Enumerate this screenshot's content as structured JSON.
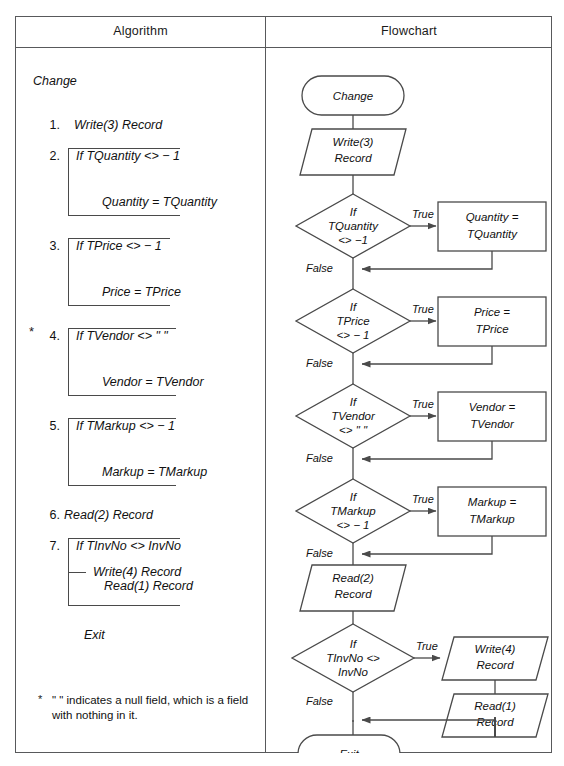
{
  "table": {
    "headers": {
      "algorithm": "Algorithm",
      "flowchart": "Flowchart"
    }
  },
  "algorithm": {
    "start_label": "Change",
    "steps": [
      {
        "num": "1.",
        "text": "Write(3) Record"
      },
      {
        "num": "2.",
        "text": "If TQuantity <> − 1",
        "body": "Quantity = TQuantity",
        "starred": false
      },
      {
        "num": "3.",
        "text": "If TPrice <> − 1",
        "body": "Price = TPrice",
        "starred": false
      },
      {
        "num": "4.",
        "text": "If TVendor <> \" \"",
        "body": "Vendor = TVendor",
        "starred": true
      },
      {
        "num": "5.",
        "text": "If TMarkup <> − 1",
        "body": "Markup = TMarkup",
        "starred": false
      },
      {
        "num": "6.",
        "text": "Read(2) Record"
      },
      {
        "num": "7.",
        "text": "If TInvNo <> InvNo",
        "body": "Write(4) Record",
        "body2": "Read(1) Record",
        "starred": false
      }
    ],
    "exit_label": "Exit",
    "star_symbol": "*",
    "footnote": "\" \" indicates a null field, which is a field",
    "footnote_line2": "with nothing in it."
  },
  "flowchart": {
    "nodes": [
      {
        "id": "start",
        "type": "terminator",
        "text": "Change"
      },
      {
        "id": "write3",
        "type": "io",
        "line1": "Write(3)",
        "line2": "Record"
      },
      {
        "id": "d-quantity",
        "type": "decision",
        "line1": "If",
        "line2": "TQuantity",
        "line3": "<> −1"
      },
      {
        "id": "p-quantity",
        "type": "process",
        "line1": "Quantity =",
        "line2": "TQuantity"
      },
      {
        "id": "d-price",
        "type": "decision",
        "line1": "If",
        "line2": "TPrice",
        "line3": "<> − 1"
      },
      {
        "id": "p-price",
        "type": "process",
        "line1": "Price =",
        "line2": "TPrice"
      },
      {
        "id": "d-vendor",
        "type": "decision",
        "line1": "If",
        "line2": "TVendor",
        "line3": "<> \" \""
      },
      {
        "id": "p-vendor",
        "type": "process",
        "line1": "Vendor =",
        "line2": "TVendor"
      },
      {
        "id": "d-markup",
        "type": "decision",
        "line1": "If",
        "line2": "TMarkup",
        "line3": "<> − 1"
      },
      {
        "id": "p-markup",
        "type": "process",
        "line1": "Markup =",
        "line2": "TMarkup"
      },
      {
        "id": "read2",
        "type": "io",
        "line1": "Read(2)",
        "line2": "Record"
      },
      {
        "id": "d-invno",
        "type": "decision",
        "line1": "If",
        "line2": "TInvNo <>",
        "line3": "InvNo"
      },
      {
        "id": "write4",
        "type": "io",
        "line1": "Write(4)",
        "line2": "Record"
      },
      {
        "id": "read1",
        "type": "io",
        "line1": "Read(1)",
        "line2": "Record"
      },
      {
        "id": "end",
        "type": "terminator",
        "text": "Exit"
      }
    ],
    "edge_labels": {
      "true": "True",
      "false": "False"
    },
    "true_labels": [
      "True",
      "True",
      "True",
      "True",
      "True"
    ],
    "false_labels": [
      "False",
      "False",
      "False",
      "False",
      "False"
    ]
  },
  "colors": {
    "stroke": "#4a4a4a",
    "border": "#58595b",
    "text": "#111111",
    "background": "#ffffff"
  }
}
